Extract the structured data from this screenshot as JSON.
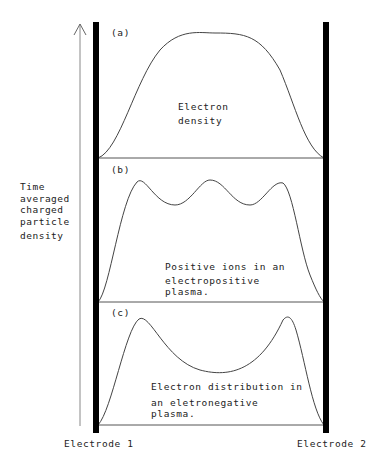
{
  "y_axis_label": [
    "Time",
    "averaged",
    "charged",
    "particle",
    "density"
  ],
  "panels": [
    {
      "tag": "(a)",
      "label_lines": [
        "Electron",
        "density"
      ]
    },
    {
      "tag": "(b)",
      "label_lines": [
        "Positive ions in an",
        "electropositive",
        "plasma."
      ]
    },
    {
      "tag": "(c)",
      "label_lines": [
        "Electron distribution in",
        "an eletronegative",
        "plasma."
      ]
    }
  ],
  "electrodes": {
    "left": "Electrode 1",
    "right": "Electrode 2"
  }
}
